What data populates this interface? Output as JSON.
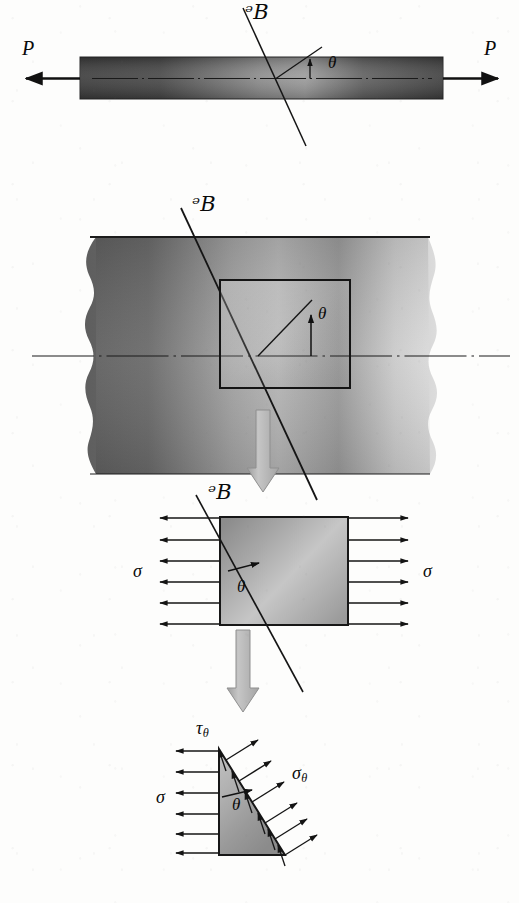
{
  "figure": {
    "domain": "diagram",
    "background_color": "#fdfdfc",
    "ink_color": "#111111",
    "panels": [
      {
        "id": "panel-1",
        "name": "prismatic-bar-axial-load",
        "elements": {
          "bar": {
            "name": "prismatic-bar",
            "fill_dark": "#3b3b3b",
            "fill_light": "#8e8e8e"
          },
          "load_left": {
            "label": "P",
            "direction": "left"
          },
          "load_right": {
            "label": "P",
            "direction": "right"
          },
          "cut_plane": {
            "label": "ᵊB",
            "name": "section-plane-pq"
          },
          "angle": {
            "label": "θ",
            "name": "inclination-angle"
          },
          "axis": {
            "name": "bar-longitudinal-axis"
          }
        }
      },
      {
        "id": "panel-2",
        "name": "enlarged-bar-region-with-stress-element",
        "elements": {
          "block": {
            "name": "bar-interior-block",
            "fill_dark": "#666666",
            "fill_light": "#c9c9c9"
          },
          "cut_plane": {
            "label": "ᵊB",
            "name": "section-plane-pq"
          },
          "angle": {
            "label": "θ",
            "name": "inclination-angle"
          },
          "square": {
            "name": "stress-element-outline"
          },
          "axis": {
            "name": "bar-longitudinal-axis"
          }
        }
      },
      {
        "id": "panel-3",
        "name": "stress-element-uniaxial-tension",
        "elements": {
          "square": {
            "name": "stress-element",
            "fill_dark": "#7d7d7d",
            "fill_light": "#cfcfcf"
          },
          "cut_plane": {
            "label": "ᵊB",
            "name": "section-plane-pq"
          },
          "angle": {
            "label": "θ",
            "name": "inclination-angle"
          },
          "stress_left": {
            "label": "σ",
            "name": "normal-stress-sigma",
            "arrow_count": 6
          },
          "stress_right": {
            "label": "σ",
            "name": "normal-stress-sigma",
            "arrow_count": 6
          }
        }
      },
      {
        "id": "panel-4",
        "name": "wedge-free-body-diagram",
        "elements": {
          "wedge": {
            "name": "triangular-wedge",
            "fill_dark": "#8a8a8a",
            "fill_light": "#c4c4c4"
          },
          "angle": {
            "label": "θ",
            "name": "inclination-angle"
          },
          "stress_sigma": {
            "label": "σ",
            "name": "normal-stress-sigma",
            "arrow_count": 6
          },
          "stress_sigma_theta": {
            "label_base": "σ",
            "label_sub": "θ",
            "name": "normal-stress-sigma-theta",
            "arrow_count": 6
          },
          "stress_tau_theta": {
            "label_base": "τ",
            "label_sub": "θ",
            "name": "shear-stress-tau-theta",
            "arrow_count": 6
          }
        }
      }
    ],
    "flow_arrows": [
      {
        "name": "flow-arrow-panel2-to-panel3",
        "direction": "down",
        "fill": "#b0b0b0"
      },
      {
        "name": "flow-arrow-panel3-to-panel4",
        "direction": "down",
        "fill": "#b0b0b0"
      }
    ],
    "labels": {
      "P": "P",
      "script_p": "ᵊB",
      "theta": "θ",
      "sigma": "σ",
      "tau": "τ"
    }
  }
}
